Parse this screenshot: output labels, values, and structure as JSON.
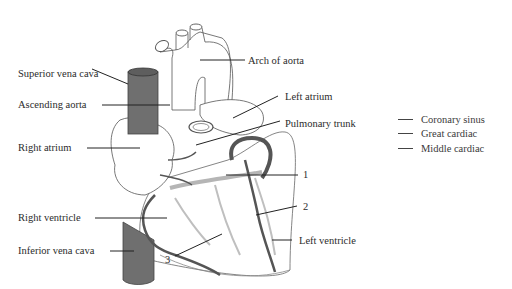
{
  "diagram": {
    "labels": {
      "superior_vena_cava": "Superior vena cava",
      "ascending_aorta": "Ascending aorta",
      "right_atrium": "Right atrium",
      "right_ventricle": "Right ventricle",
      "inferior_vena_cava": "Inferior vena cava",
      "arch_of_aorta": "Arch of aorta",
      "left_atrium": "Left atrium",
      "pulmonary_trunk": "Pulmonary trunk",
      "left_ventricle": "Left ventricle"
    },
    "numbers": {
      "one": "1",
      "two": "2",
      "three": "3"
    },
    "legend": [
      {
        "label": "Coronary sinus"
      },
      {
        "label": "Great cardiac"
      },
      {
        "label": "Middle cardiac"
      }
    ],
    "colors": {
      "vena_cava": "#6f6f6f",
      "dark_vessel": "#555555",
      "light_vessel": "#b5b5b5",
      "outline": "#4a4a4a"
    }
  }
}
